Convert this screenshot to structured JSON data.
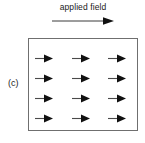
{
  "figure": {
    "width": 145,
    "height": 143,
    "background_color": "#ffffff",
    "panel_label": "(c)",
    "caption": "applied field",
    "line_color": "#6f6f6f",
    "arrow_color": "#111111",
    "box": {
      "x": 28,
      "y": 38,
      "width": 110,
      "height": 93,
      "border_color": "#6f6f6f",
      "fill": "#ffffff"
    },
    "field_arrow": {
      "name": "applied-field-arrow",
      "direction": "right",
      "x": 52,
      "y": 15,
      "length": 62
    },
    "grid": {
      "rows": 4,
      "columns": 3,
      "arrow_direction": "right",
      "row_y": [
        54,
        74,
        94,
        114
      ],
      "column_x": [
        35,
        72,
        108
      ],
      "arrows": [
        {
          "row": 1,
          "column": 1,
          "direction": "right",
          "x": 35,
          "y": 54
        },
        {
          "row": 1,
          "column": 2,
          "direction": "right",
          "x": 72,
          "y": 54
        },
        {
          "row": 1,
          "column": 3,
          "direction": "right",
          "x": 108,
          "y": 54
        },
        {
          "row": 2,
          "column": 1,
          "direction": "right",
          "x": 35,
          "y": 74
        },
        {
          "row": 2,
          "column": 2,
          "direction": "right",
          "x": 72,
          "y": 74
        },
        {
          "row": 2,
          "column": 3,
          "direction": "right",
          "x": 108,
          "y": 74
        },
        {
          "row": 3,
          "column": 1,
          "direction": "right",
          "x": 35,
          "y": 94
        },
        {
          "row": 3,
          "column": 2,
          "direction": "right",
          "x": 72,
          "y": 94
        },
        {
          "row": 3,
          "column": 3,
          "direction": "right",
          "x": 108,
          "y": 94
        },
        {
          "row": 4,
          "column": 1,
          "direction": "right",
          "x": 35,
          "y": 114
        },
        {
          "row": 4,
          "column": 2,
          "direction": "right",
          "x": 72,
          "y": 114
        },
        {
          "row": 4,
          "column": 3,
          "direction": "right",
          "x": 108,
          "y": 114
        }
      ]
    }
  }
}
